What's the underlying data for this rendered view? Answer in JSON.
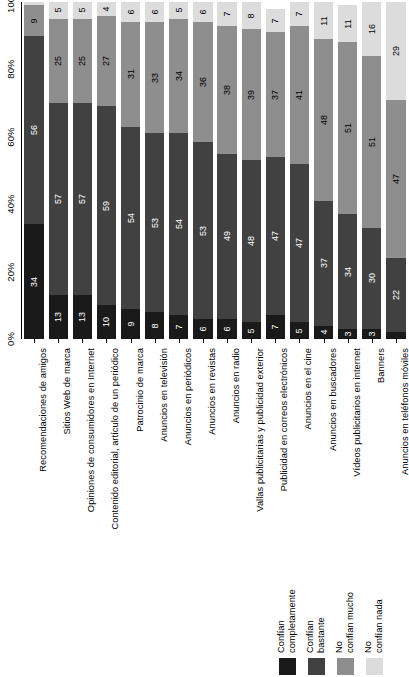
{
  "chart_data": {
    "type": "bar",
    "orientation": "vertical-stacked-rotated",
    "title": "",
    "subtitle": "",
    "xlabel": "",
    "ylabel": "",
    "ylim": [
      0,
      100
    ],
    "grid": false,
    "legend_position": "bottom-right",
    "axis_ticks": [
      "0%",
      "20%",
      "40%",
      "60%",
      "80%",
      "100%"
    ],
    "axis_tick_values": [
      0,
      20,
      40,
      60,
      80,
      100
    ],
    "categories": [
      "Recomendaciones de amigos",
      "Sitios Web de marca",
      "Opiniones de consumidores en Internet",
      "Contenido editorial, artículo de un periódico",
      "Patrocinio de marca",
      "Anuncios en televisión",
      "Anuncios en periódicos",
      "Anuncios en revistas",
      "Anuncios en radio",
      "Vallas publicitarias y publicidad exterior",
      "Publicidad en correos electrónicos",
      "Anuncios en el cine",
      "Anuncios en buscadores",
      "Vídeos publicitarios en internet",
      "Banners",
      "Anuncios en teléfonos móviles"
    ],
    "series": [
      {
        "name": "Confían completamente",
        "color": "#1a1a1a",
        "label_color": "#ffffff",
        "values": [
          34,
          13,
          13,
          10,
          9,
          8,
          7,
          6,
          6,
          5,
          7,
          5,
          4,
          3,
          3,
          2
        ]
      },
      {
        "name": "Confían bastante",
        "color": "#414141",
        "label_color": "#ffffff",
        "values": [
          56,
          57,
          57,
          59,
          54,
          53,
          54,
          53,
          49,
          48,
          47,
          47,
          37,
          34,
          30,
          22
        ]
      },
      {
        "name": "No confían mucho",
        "color": "#8e8e8e",
        "label_color": "#000000",
        "values": [
          9,
          25,
          25,
          27,
          31,
          33,
          34,
          36,
          38,
          39,
          37,
          41,
          48,
          51,
          51,
          47
        ]
      },
      {
        "name": "No confían nada",
        "color": "#dcdcdc",
        "label_color": "#000000",
        "values": [
          1,
          5,
          5,
          4,
          6,
          6,
          5,
          6,
          7,
          8,
          7,
          7,
          11,
          11,
          16,
          29
        ]
      }
    ]
  }
}
